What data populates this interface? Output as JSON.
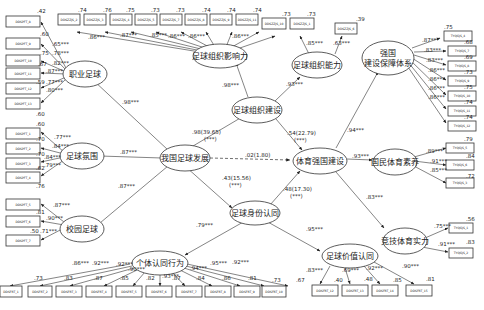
{
  "latents": {
    "zhiye": "职业足球",
    "fenwei": "足球氛围",
    "xiaoyuan": "校园足球",
    "fazhan": "我国足球发展",
    "zuzhi_yingxiang": "足球组织影响力",
    "zuzhi_jianshe": "足球组织建设",
    "zuzhi_nengli": "足球组织能力",
    "tiyu_qiangguo": "体育强国建设",
    "baozhang_line1": "强国",
    "baozhang_line2": "建设保障体系",
    "guomin": "国民体育素养",
    "jingji": "竞技体育实力",
    "shenfen": "足球身份认同",
    "geti": "个体认同行为",
    "jiazhi": "足球价值认同"
  },
  "structural_paths": {
    "fazhan_to_zhiye": ".98***",
    "fazhan_to_fenwei": ".87***",
    "fazhan_to_xiaoyuan": ".87***",
    "fazhan_to_jianshe_a": ".98(39.65)",
    "fazhan_to_jianshe_b": "(***)",
    "fazhan_to_tiyu": ".02(1.80)",
    "fazhan_to_shenfen_a": ".43(15.56)",
    "fazhan_to_shenfen_b": "(***)",
    "jianshe_to_yingxiang": ".98***",
    "jianshe_to_nengli": ".93***",
    "jianshe_to_tiyu_a": ".54(22.79)",
    "jianshe_to_tiyu_b": "(***)",
    "shenfen_to_tiyu_a": ".48(17.30)",
    "shenfen_to_tiyu_b": "(***)",
    "shenfen_to_geti": ".79***",
    "shenfen_to_jiazhi": ".95***",
    "tiyu_to_baozhang": ".94***",
    "tiyu_to_guomin": ".93***",
    "tiyu_to_jingji": ".83***"
  },
  "indicators": {
    "zhiye": [
      {
        "name": "DDSPFT_8",
        "r2": ".42",
        "load": ".65***"
      },
      {
        "name": "DDSPFT_9",
        "r2": ".60",
        "load": ".78***"
      },
      {
        "name": "DDSPFT_10",
        "r2": ".75",
        "load": ".82***"
      },
      {
        "name": "DDSPFT_11",
        "r2": ".67",
        "load": ".87***"
      },
      {
        "name": "DDSPFT_12",
        "r2": ".59",
        "load": ".77***"
      },
      {
        "name": "DDSPFT_13",
        "r2": ".60",
        "load": ".80***"
      }
    ],
    "fenwei": [
      {
        "name": "DDSPFT_1",
        "r2": ".60",
        "load": ".77***"
      },
      {
        "name": "DDSPFT_2",
        "r2": ".70",
        "load": ".84***"
      },
      {
        "name": "DDSPFT_3",
        "r2": ".70",
        "load": ".84***"
      },
      {
        "name": "DDSPFT_4",
        "r2": ".62",
        "load": ".79***"
      }
    ],
    "xiaoyuan": [
      {
        "name": "DDSPFT_5",
        "r2": ".76",
        "load": ".87***"
      },
      {
        "name": "DDSPFT_6",
        "r2": ".81",
        "load": ".90***"
      },
      {
        "name": "DDSPFT_7",
        "r2": ".50",
        "load": ".71***"
      }
    ],
    "yingxiang": [
      {
        "name": "DDSZZJS_2",
        "r2": ".74",
        "load": ".86***"
      },
      {
        "name": "DDSZZJS_3",
        "r2": ".76",
        "load": ".87***"
      },
      {
        "name": "DDSZZJS_4",
        "r2": ".75",
        "load": ".87***"
      },
      {
        "name": "DDSZZJS_5",
        "r2": ".73",
        "load": ".85***"
      },
      {
        "name": "DDSZZJS_7",
        "r2": ".73",
        "load": ".86***"
      },
      {
        "name": "DDSZZJS_8",
        "r2": ".74",
        "load": ".86***"
      },
      {
        "name": "DDSZZJS_9",
        "r2": ".74",
        "load": ".86***"
      },
      {
        "name": "DDSZZJS_11",
        "r2": ".74",
        "load": ".86***"
      },
      {
        "name": "DDSZZJS_10",
        "r2": ".73",
        "load": ".85***"
      }
    ],
    "nengli": [
      {
        "name": "DDSZZJS_1",
        "r2": ".73",
        "load": ".85***"
      },
      {
        "name": "DDSZZJS_6",
        "r2": ".39",
        "load": ".63***"
      }
    ],
    "baozhang": [
      {
        "name": "TYQGJS_4",
        "r2": ".75",
        "load": ".87***"
      },
      {
        "name": "TYQGJS_7",
        "r2": ".68",
        "load": ".83***"
      },
      {
        "name": "TYQGJS_8",
        "r2": ".69",
        "load": ".83***"
      },
      {
        "name": "TYQGJS_9",
        "r2": ".73",
        "load": ".86***"
      },
      {
        "name": "TYQGJS_10",
        "r2": ".75",
        "load": ".86***"
      },
      {
        "name": "TYQGJS_11",
        "r2": ".74",
        "load": ".86***"
      },
      {
        "name": "TYQGJS_12",
        "r2": ".74",
        "load": ".86***"
      }
    ],
    "guomin": [
      {
        "name": "TYQGJS_5",
        "r2": ".79",
        "load": ".89***"
      },
      {
        "name": "TYQGJS_6",
        "r2": ".84",
        "load": ".91***"
      },
      {
        "name": "TYQGJS_3",
        "r2": ".72",
        "load": ".85***"
      }
    ],
    "jingji": [
      {
        "name": "TYQGJS_1",
        "r2": ".56",
        "load": ".75***"
      },
      {
        "name": "TYQGJS_2",
        "r2": ".83",
        "load": ".91***"
      }
    ],
    "geti": [
      {
        "name": "DDSFRT_1",
        "r2": ".73",
        "load": ".86***"
      },
      {
        "name": "DDSFRT_2",
        "r2": ".83",
        "load": ".92***"
      },
      {
        "name": "DDSFRT_3",
        "r2": ".87",
        "load": ".92***"
      },
      {
        "name": "DDSFRT_4",
        "r2": ".85",
        "load": ".90***"
      },
      {
        "name": "DDSFRT_5",
        "r2": ".82",
        "load": ".90***"
      },
      {
        "name": "DDSFRT_6",
        "r2": ".87",
        "load": ".93***"
      },
      {
        "name": "DDSFRT_7",
        "r2": ".84",
        "load": ".94***"
      },
      {
        "name": "DDSFRT_8",
        "r2": ".86",
        "load": ".93***"
      },
      {
        "name": "DDSFRT_9",
        "r2": ".81",
        "load": ".95***"
      },
      {
        "name": "DDSFRT_10",
        "r2": ".73",
        "load": ".92***"
      },
      {
        "name": "DDSFRT_11",
        "r2": ".67",
        "load": ".82***"
      }
    ],
    "jiazhi": [
      {
        "name": "DDSFRT_12",
        "r2": ".40",
        "load": ".83***"
      },
      {
        "name": "DDSFRT_13",
        "r2": ".48",
        "load": ".69***"
      },
      {
        "name": "DDSFRT_14",
        "r2": ".85",
        "load": ".92***"
      },
      {
        "name": "DDSFRT_15",
        "r2": ".81",
        "load": ".90***"
      }
    ]
  }
}
